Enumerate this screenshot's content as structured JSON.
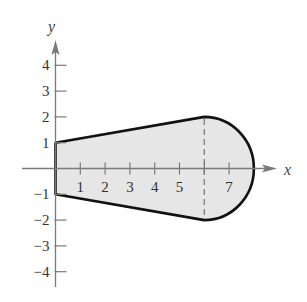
{
  "chart_data": {
    "type": "area",
    "title": "",
    "xlabel": "x",
    "ylabel": "y",
    "xlim": [
      0,
      8.6
    ],
    "ylim": [
      -4.5,
      4.8
    ],
    "grid": false,
    "x_ticks": [
      1,
      2,
      3,
      4,
      5,
      6,
      7
    ],
    "x_tick_labels": [
      "1",
      "2",
      "3",
      "4",
      "5",
      "",
      "7"
    ],
    "y_ticks": [
      4,
      3,
      2,
      1,
      -1,
      -2,
      -3,
      -4
    ],
    "y_tick_labels": [
      "4",
      "3",
      "2",
      "1",
      "−1",
      "−2",
      "−3",
      "−4"
    ],
    "region": {
      "description": "Shaded region bounded by y = 1 + x/6 (top), y = -1 - x/6 (bottom) for 0 <= x <= 6, and a semicircular arc (x-6)^2 + y^2 = 4 for 6 <= x <= 8",
      "upper_line": {
        "from": [
          0,
          1
        ],
        "to": [
          6,
          2
        ]
      },
      "lower_line": {
        "from": [
          0,
          -1
        ],
        "to": [
          6,
          -2
        ]
      },
      "arc": {
        "center": [
          6,
          0
        ],
        "radius": 2,
        "from": [
          6,
          2
        ],
        "to": [
          6,
          -2
        ],
        "through": [
          8,
          0
        ]
      },
      "fill_color": "#e6e6e6",
      "stroke_color": "#111111"
    },
    "annotations": [
      {
        "type": "dashed_vertical_line",
        "x": 6,
        "from_y": -2,
        "to_y": 2
      }
    ]
  },
  "colors": {
    "axis": "#7a7a7a",
    "boundary": "#111111",
    "fill": "#e6e6e6",
    "dashed": "#777777",
    "text": "#333333"
  }
}
